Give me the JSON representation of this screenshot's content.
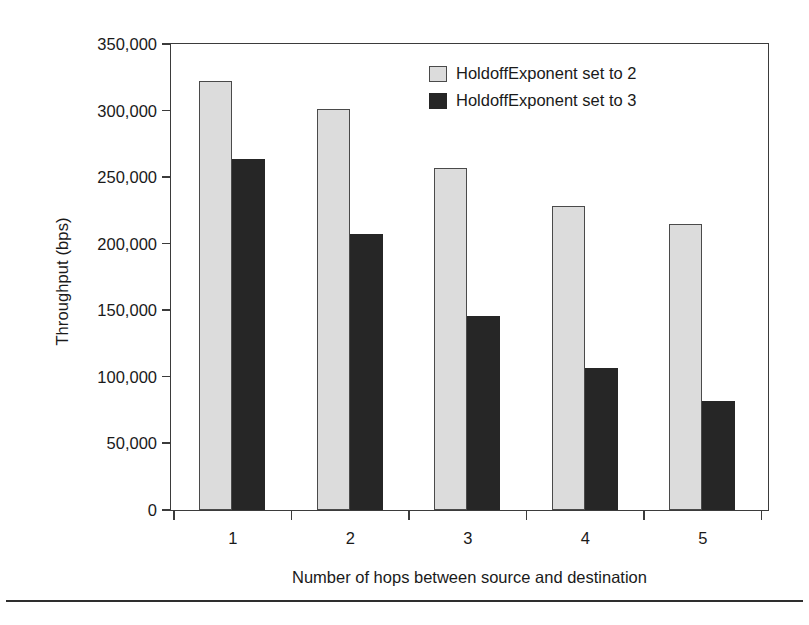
{
  "chart_data": {
    "type": "bar",
    "title": "",
    "xlabel": "Number of hops between source and destination",
    "ylabel": "Throughput (bps)",
    "categories": [
      "1",
      "2",
      "3",
      "4",
      "5"
    ],
    "series": [
      {
        "name": "HoldoffExponent set to 2",
        "color": "#dcdcdc",
        "values": [
          322000,
          301000,
          257000,
          228000,
          215000
        ]
      },
      {
        "name": "HoldoffExponent set to 3",
        "color": "#262626",
        "values": [
          264000,
          207000,
          146000,
          107000,
          82000
        ]
      }
    ],
    "ylim": [
      0,
      350000
    ],
    "ytick_values": [
      0,
      50000,
      100000,
      150000,
      200000,
      250000,
      300000,
      350000
    ],
    "ytick_labels": [
      "0",
      "50,000",
      "100,000",
      "150,000",
      "200,000",
      "250,000",
      "300,000",
      "350,000"
    ],
    "grid": false,
    "legend_position": "top-right-inside"
  }
}
